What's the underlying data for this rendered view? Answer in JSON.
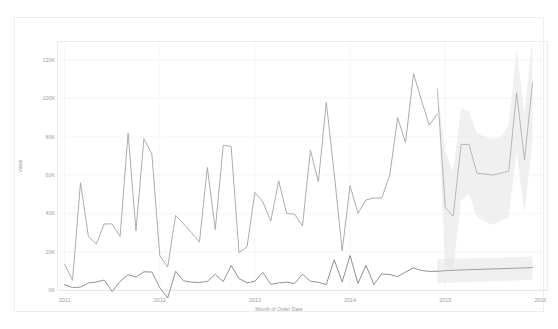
{
  "chart_data": {
    "type": "line",
    "title": "",
    "xlabel": "Month of Order Date",
    "ylabel": "Value",
    "xlim": [
      "2011",
      "2016"
    ],
    "ylim": [
      0,
      130000
    ],
    "grid": true,
    "legend_position": "none",
    "y_ticks": [
      "0K",
      "20K",
      "40K",
      "60K",
      "80K",
      "100K",
      "120K"
    ],
    "y_tick_values": [
      0,
      20000,
      40000,
      60000,
      80000,
      100000,
      120000
    ],
    "x_ticks": [
      "2011",
      "2012",
      "2013",
      "2014",
      "2015",
      "2016"
    ],
    "x_tick_values": [
      2011,
      2012,
      2013,
      2014,
      2015,
      2016
    ],
    "colors": {
      "series_upper": "#a8a8a8",
      "series_lower": "#8b8b8b",
      "forecast_band": "#e3e3e3",
      "gridline": "#f0f2f4",
      "axis_text": "#9aa0a6"
    },
    "annotations": [
      {
        "label": "forecast-start",
        "x": 2014.92
      }
    ],
    "series": [
      {
        "name": "Sales",
        "kind": "actual",
        "color": "#a8a8a8",
        "x": [
          2011.0,
          2011.083,
          2011.167,
          2011.25,
          2011.333,
          2011.417,
          2011.5,
          2011.583,
          2011.667,
          2011.75,
          2011.833,
          2011.917,
          2012.0,
          2012.083,
          2012.167,
          2012.25,
          2012.333,
          2012.417,
          2012.5,
          2012.583,
          2012.667,
          2012.75,
          2012.833,
          2012.917,
          2013.0,
          2013.083,
          2013.167,
          2013.25,
          2013.333,
          2013.417,
          2013.5,
          2013.583,
          2013.667,
          2013.75,
          2013.833,
          2013.917,
          2014.0,
          2014.083,
          2014.167,
          2014.25,
          2014.333,
          2014.417,
          2014.5,
          2014.583,
          2014.667,
          2014.75,
          2014.833,
          2014.917
        ],
        "values": [
          13500,
          5000,
          56000,
          28000,
          24000,
          34500,
          34500,
          28000,
          82000,
          31000,
          79000,
          71000,
          18000,
          12000,
          39000,
          34500,
          30000,
          25000,
          64000,
          31500,
          75500,
          75000,
          19500,
          22500,
          51000,
          46000,
          36000,
          57000,
          40000,
          39500,
          33500,
          73000,
          56500,
          98000,
          61000,
          20500,
          54500,
          40000,
          47000,
          48000,
          48000,
          60000,
          90000,
          77000,
          113000,
          99000,
          86000,
          92000
        ]
      },
      {
        "name": "Profit",
        "kind": "actual",
        "color": "#8b8b8b",
        "x": [
          2011.0,
          2011.083,
          2011.167,
          2011.25,
          2011.333,
          2011.417,
          2011.5,
          2011.583,
          2011.667,
          2011.75,
          2011.833,
          2011.917,
          2012.0,
          2012.083,
          2012.167,
          2012.25,
          2012.333,
          2012.417,
          2012.5,
          2012.583,
          2012.667,
          2012.75,
          2012.833,
          2012.917,
          2013.0,
          2013.083,
          2013.167,
          2013.25,
          2013.333,
          2013.417,
          2013.5,
          2013.583,
          2013.667,
          2013.75,
          2013.833,
          2013.917,
          2014.0,
          2014.083,
          2014.167,
          2014.25,
          2014.333,
          2014.417,
          2014.5,
          2014.583,
          2014.667,
          2014.75,
          2014.833,
          2014.917
        ],
        "values": [
          2800,
          1300,
          1500,
          3700,
          4200,
          5200,
          -800,
          4500,
          8000,
          6800,
          9500,
          9400,
          1200,
          -4200,
          9800,
          4800,
          4100,
          3900,
          4500,
          8200,
          4400,
          12800,
          6000,
          3700,
          4600,
          9200,
          3000,
          3700,
          4100,
          3400,
          8200,
          4600,
          4000,
          2900,
          15800,
          4200,
          18000,
          3400,
          12900,
          2900,
          8400,
          8100,
          7000,
          9400,
          11500,
          10200,
          9700,
          9800
        ]
      },
      {
        "name": "Sales Forecast",
        "kind": "forecast",
        "color": "#a8a8a8",
        "x": [
          2014.917,
          2015.0,
          2015.083,
          2015.167,
          2015.25,
          2015.333,
          2015.417,
          2015.5,
          2015.583,
          2015.667,
          2015.75,
          2015.833,
          2015.917
        ],
        "values": [
          105000,
          43000,
          38500,
          76000,
          76000,
          61000,
          60500,
          60000,
          61000,
          62000,
          103000,
          68000,
          108000
        ],
        "band_upper": [
          105000,
          72000,
          62000,
          95000,
          93000,
          82000,
          80000,
          79000,
          80000,
          86000,
          126000,
          92000,
          132000
        ],
        "band_lower": [
          105000,
          13000,
          10000,
          47000,
          50000,
          38000,
          36000,
          34000,
          36000,
          38000,
          72000,
          40000,
          78000
        ]
      },
      {
        "name": "Profit Forecast",
        "kind": "forecast",
        "color": "#8b8b8b",
        "x": [
          2014.917,
          2015.0,
          2015.25,
          2015.5,
          2015.75,
          2015.917
        ],
        "values": [
          9700,
          10100,
          10600,
          11000,
          11400,
          11700
        ],
        "band_upper": [
          16000,
          16300,
          16600,
          16900,
          17200,
          17500
        ],
        "band_lower": [
          3500,
          3800,
          4200,
          4600,
          5000,
          5300
        ]
      }
    ]
  },
  "chart": {
    "axis_title_x": "Month of Order Date",
    "axis_title_y": "Value"
  }
}
